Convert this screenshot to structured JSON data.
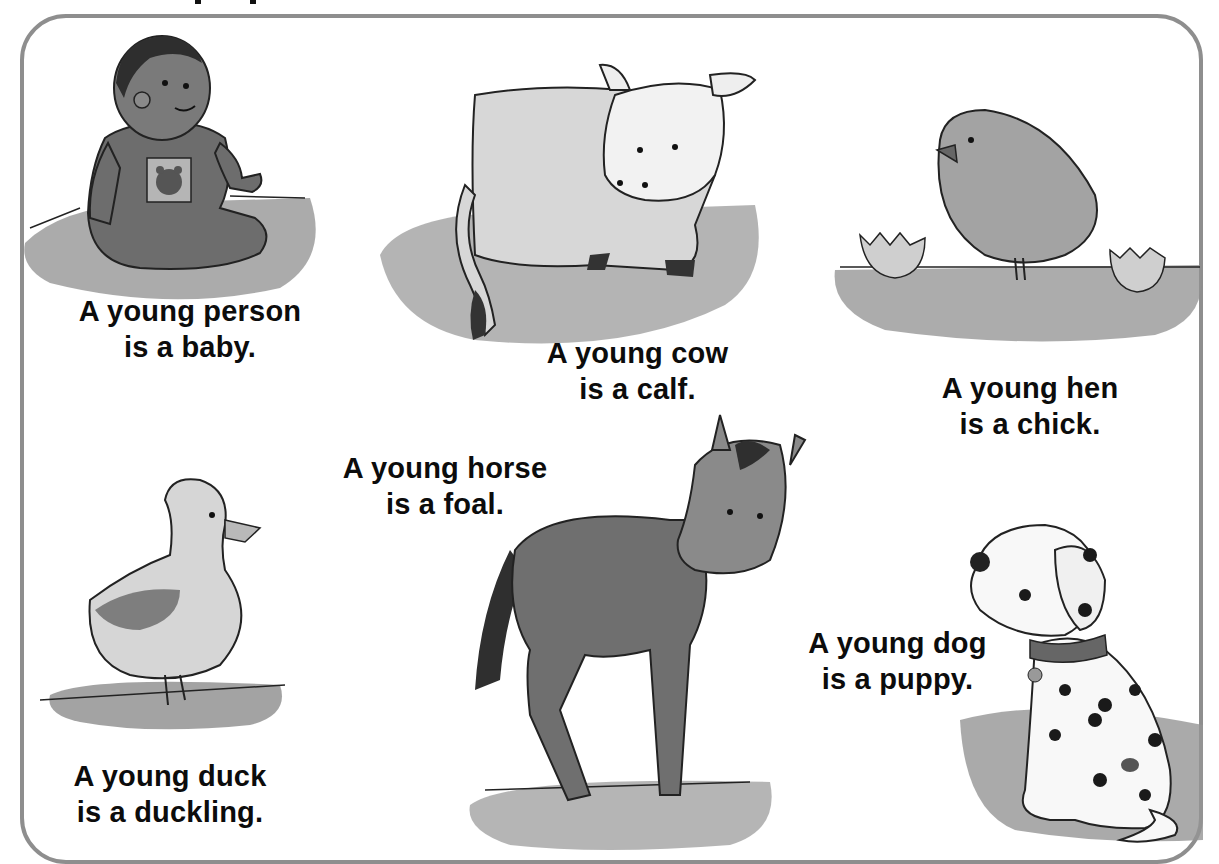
{
  "page": {
    "header_partial": "",
    "border_color": "#8e8e8e",
    "text_color": "#0c0c0c"
  },
  "cards": [
    {
      "animal": "person",
      "line1": "A young person",
      "line2": "is a baby."
    },
    {
      "animal": "cow",
      "line1": "A young cow",
      "line2": "is a calf."
    },
    {
      "animal": "hen",
      "line1": "A young hen",
      "line2": "is a chick."
    },
    {
      "animal": "duck",
      "line1": "A young duck",
      "line2": "is a duckling."
    },
    {
      "animal": "horse",
      "line1": "A young horse",
      "line2": "is a foal."
    },
    {
      "animal": "dog",
      "line1": "A young dog",
      "line2": "is a puppy."
    }
  ],
  "icons": {
    "baby": "baby-illustration",
    "calf": "calf-illustration",
    "chick": "chick-illustration",
    "duckling": "duckling-illustration",
    "foal": "foal-illustration",
    "puppy": "puppy-illustration"
  }
}
